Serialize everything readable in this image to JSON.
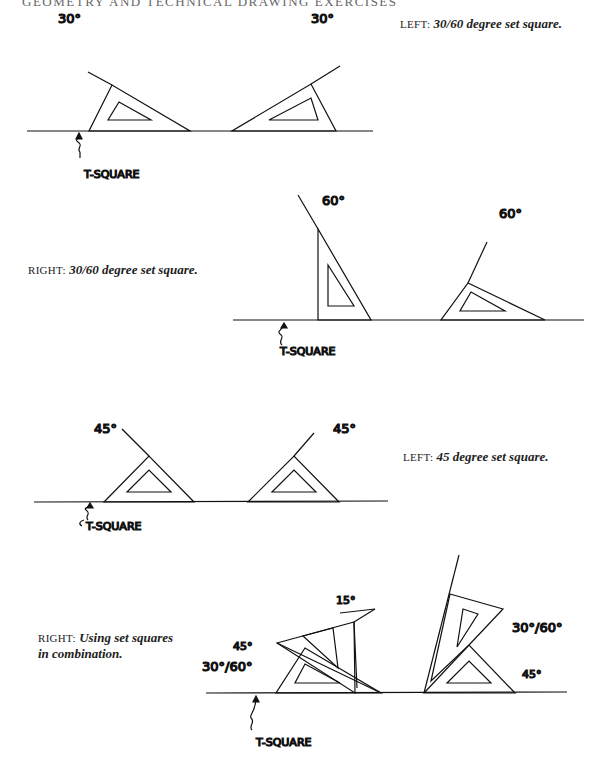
{
  "page": {
    "running_header": "GEOMETRY AND TECHNICAL DRAWING EXERCISES"
  },
  "figures": [
    {
      "id": "fig1",
      "caption_lead": "LEFT:",
      "caption_text": "30/60 degree set square.",
      "labels": [
        "30°",
        "30°"
      ],
      "tsquare_label": "T-SQUARE"
    },
    {
      "id": "fig2",
      "caption_lead": "RIGHT:",
      "caption_text": "30/60 degree set square.",
      "labels": [
        "60°",
        "60°"
      ],
      "tsquare_label": "T-SQUARE"
    },
    {
      "id": "fig3",
      "caption_lead": "LEFT:",
      "caption_text": "45 degree set square.",
      "labels": [
        "45°",
        "45°"
      ],
      "tsquare_label": "T-SQUARE"
    },
    {
      "id": "fig4",
      "caption_lead": "RIGHT:",
      "caption_text_line1": "Using set squares",
      "caption_text_line2": "in combination.",
      "labels": [
        "15°",
        "45°",
        "30°/60°",
        "30°/60°",
        "45°"
      ],
      "tsquare_label": "T-SQUARE"
    }
  ]
}
